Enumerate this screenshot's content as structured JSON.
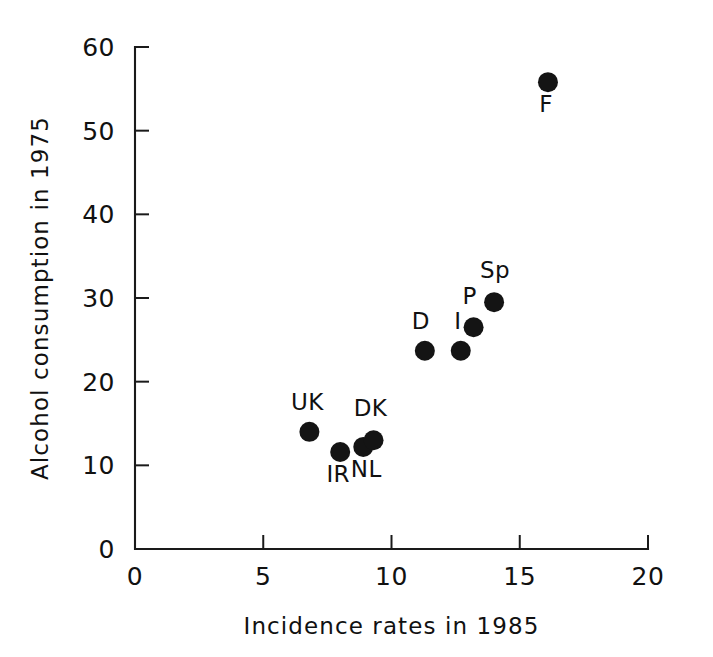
{
  "chart_data": {
    "type": "scatter",
    "title": "",
    "xlabel": "Incidence rates  in 1985",
    "ylabel": "Alcohol consumption  in 1975",
    "xlim": [
      0,
      20
    ],
    "ylim": [
      0,
      60
    ],
    "xticks": [
      "0",
      "5",
      "10",
      "15",
      "20"
    ],
    "xtick_values": [
      0,
      5,
      10,
      15,
      20
    ],
    "yticks": [
      "0",
      "10",
      "20",
      "30",
      "40",
      "50",
      "60"
    ],
    "ytick_values": [
      0,
      10,
      20,
      30,
      40,
      50,
      60
    ],
    "grid": false,
    "legend": false,
    "marker": "filled-circle",
    "marker_color": "#141414",
    "points": [
      {
        "label": "UK",
        "x": 6.8,
        "y": 14.0,
        "label_dx": -2,
        "label_dy": -22
      },
      {
        "label": "IR",
        "x": 8.0,
        "y": 11.6,
        "label_dx": -2,
        "label_dy": 30
      },
      {
        "label": "NL",
        "x": 8.9,
        "y": 12.2,
        "label_dx": 3,
        "label_dy": 30
      },
      {
        "label": "DK",
        "x": 9.3,
        "y": 13.0,
        "label_dx": -3,
        "label_dy": -24
      },
      {
        "label": "D",
        "x": 11.3,
        "y": 23.7,
        "label_dx": -4,
        "label_dy": -22
      },
      {
        "label": "I",
        "x": 12.7,
        "y": 23.7,
        "label_dx": -3,
        "label_dy": -22
      },
      {
        "label": "P",
        "x": 13.2,
        "y": 26.5,
        "label_dx": -4,
        "label_dy": -23
      },
      {
        "label": "Sp",
        "x": 14.0,
        "y": 29.5,
        "label_dx": 1,
        "label_dy": -24
      },
      {
        "label": "F",
        "x": 16.1,
        "y": 55.8,
        "label_dx": -2,
        "label_dy": 30
      }
    ]
  }
}
